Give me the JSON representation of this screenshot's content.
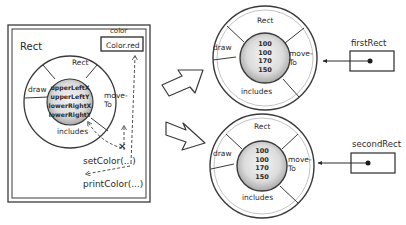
{
  "left_panel": {
    "class_label": "Rect",
    "field_label": "color",
    "field_value": "Color.red",
    "object": {
      "top": "Rect",
      "left": "draw",
      "right_line1": "move-",
      "right_line2": "To",
      "bottom": "includes",
      "core_fields": [
        "upperLeftX",
        "upperLeftY",
        "lowerRightX",
        "lowerRightY"
      ]
    },
    "methods": [
      "setColor(...)",
      "printColor(...)"
    ]
  },
  "instances": [
    {
      "reference_label": "firstRect",
      "object": {
        "top": "Rect",
        "left": "draw",
        "right_line1": "move-",
        "right_line2": "To",
        "bottom": "includes",
        "core_values": [
          "100",
          "100",
          "170",
          "150"
        ]
      }
    },
    {
      "reference_label": "secondRect",
      "object": {
        "top": "Rect",
        "left": "draw",
        "right_line1": "move-",
        "right_line2": "To",
        "bottom": "includes",
        "core_values": [
          "100",
          "100",
          "170",
          "150"
        ]
      }
    }
  ],
  "colors": {
    "stroke": "#3a3a3a",
    "ring_fill": "#ffffff",
    "core_fill": "#d6d6d6",
    "core_highlight": "#f2f2f2"
  }
}
